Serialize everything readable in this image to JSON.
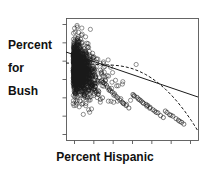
{
  "figure": {
    "kind": "scatterplot-with-fit-lines",
    "background": "#ffffff",
    "ink_color": "#1a1a1a",
    "axis_color": "#555555"
  },
  "axes": {
    "y_label_lines": [
      "Percent",
      "for",
      "Bush"
    ],
    "x_label": "Percent Hispanic",
    "y_tick_count": 7,
    "x_tick_count": 7,
    "tick_labels_shown": false,
    "frame": {
      "left": 66,
      "top": 18,
      "right": 198,
      "bottom": 140
    }
  },
  "chart_data": {
    "type": "scatter",
    "title": "",
    "xlabel": "Percent Hispanic",
    "ylabel": "Percent for Bush",
    "xlim": [
      0,
      100
    ],
    "ylim": [
      0,
      100
    ],
    "grid": false,
    "legend": "none",
    "marker": {
      "shape": "open-circle",
      "size": 2.1,
      "color": "#1a1a1a"
    },
    "n_points": 1100,
    "series": [
      {
        "name": "counties",
        "x": [
          3.4,
          2.1,
          5.6,
          1.8,
          4.2,
          7.9,
          2.6,
          3.1,
          6.4,
          1.2,
          9.8,
          4.7,
          2.9,
          5.1,
          3.8,
          8.2,
          1.6,
          4.4,
          6.8,
          2.3,
          12.4,
          15.1,
          10.2,
          18.6,
          22.3,
          13.7,
          9.1,
          16.8,
          11.5,
          25.4,
          19.2,
          14.3,
          8.6,
          17.1,
          21.7,
          12.9,
          10.8,
          23.6,
          15.9,
          20.1,
          31.2,
          28.7,
          35.4,
          26.1,
          41.8,
          33.6,
          29.4,
          38.2,
          24.9,
          45.1,
          30.8,
          36.7,
          27.3,
          43.2,
          32.1,
          39.8,
          25.6,
          47.4,
          34.9,
          42.6,
          55.3,
          61.7,
          52.1,
          58.9,
          67.4,
          63.2,
          50.8,
          71.6,
          56.4,
          65.1,
          59.7,
          73.8,
          54.2,
          68.9,
          62.3,
          76.1,
          51.4,
          70.2,
          64.8,
          57.6,
          81.3,
          86.7,
          79.2,
          91.4,
          84.1,
          88.6,
          77.8,
          93.2,
          82.5,
          89.9,
          2.2,
          3.7,
          1.4,
          5.9,
          4.1,
          6.6,
          2.8,
          3.3,
          7.2,
          1.9,
          4.8,
          2.4,
          5.3,
          3.6,
          6.1,
          2.7,
          4.3,
          8.4,
          1.7,
          5.8
        ],
        "y": [
          62.1,
          58.4,
          71.2,
          54.6,
          66.8,
          49.3,
          73.5,
          60.2,
          45.8,
          68.9,
          52.4,
          64.7,
          57.1,
          70.3,
          61.5,
          47.2,
          75.8,
          55.9,
          42.6,
          69.4,
          51.3,
          46.8,
          58.2,
          41.4,
          38.7,
          53.6,
          61.2,
          44.1,
          49.8,
          33.2,
          39.6,
          47.3,
          56.4,
          43.8,
          36.1,
          50.7,
          54.2,
          31.8,
          45.4,
          37.9,
          41.2,
          44.6,
          36.8,
          47.1,
          29.4,
          38.2,
          42.7,
          33.1,
          48.6,
          26.3,
          40.1,
          34.7,
          45.8,
          27.9,
          39.4,
          31.2,
          46.9,
          24.1,
          35.6,
          28.4,
          32.1,
          27.4,
          34.8,
          29.1,
          22.6,
          26.3,
          36.2,
          19.8,
          31.4,
          24.7,
          28.2,
          17.3,
          33.6,
          21.4,
          25.8,
          15.6,
          35.1,
          20.2,
          23.9,
          30.4,
          18.2,
          14.6,
          20.1,
          11.3,
          16.8,
          13.2,
          21.4,
          9.7,
          17.6,
          12.1,
          78.4,
          74.2,
          81.6,
          69.3,
          76.1,
          66.8,
          79.2,
          75.6,
          63.4,
          80.1,
          59.7,
          72.8,
          56.2,
          65.4,
          53.8,
          70.1,
          61.8,
          48.2,
          77.3,
          55.1
        ]
      }
    ],
    "fit_lines": [
      {
        "name": "ols-linear-fit",
        "style": "solid",
        "color": "#1a1a1a",
        "width": 1.0,
        "endpoints_px": [
          [
            66,
            52
          ],
          [
            198,
            97
          ]
        ],
        "note": "Straight least-squares regression line, negative slope"
      },
      {
        "name": "lowess-smoother",
        "style": "dashed",
        "dash": "3,2",
        "color": "#1a1a1a",
        "width": 1.0,
        "note": "Non-parametric smoother; flat-to-gentle through the dense cluster, then steepening downward at high Percent Hispanic"
      }
    ]
  }
}
